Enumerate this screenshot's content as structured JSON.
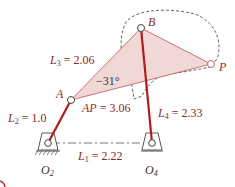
{
  "diagram": {
    "type": "four-bar linkage with coupler point",
    "colors": {
      "link": "#b01c1c",
      "coupler_fill": "#f0d8d6",
      "coupler_edge": "#c46464",
      "label": "#8b2a2a",
      "ground_label": "#333333",
      "dashed": "#555555"
    },
    "points": {
      "A": "A",
      "B": "B",
      "P": "P",
      "O2": "O",
      "O2_sub": "2",
      "O4": "O",
      "O4_sub": "4"
    },
    "labels": {
      "L1_name": "L",
      "L1_sub": "1",
      "L1_value": " = 2.22",
      "L2_name": "L",
      "L2_sub": "2",
      "L2_value": " = 1.0",
      "L3_name": "L",
      "L3_sub": "3",
      "L3_value": " = 2.06",
      "L4_name": "L",
      "L4_sub": "4",
      "L4_value": " = 2.33",
      "AP_name": "AP",
      "AP_value": " = 3.06",
      "angle": "−31°"
    }
  }
}
